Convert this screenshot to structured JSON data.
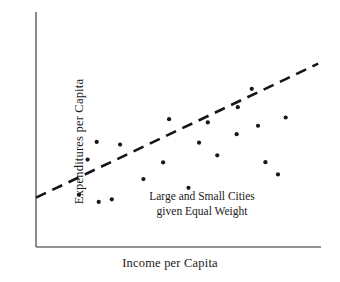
{
  "chart_data": {
    "type": "scatter",
    "title": "",
    "xlabel": "Income per Capita",
    "ylabel": "Expenditures per Capita",
    "annotation": {
      "line1": "Large and Small Cities",
      "line2": "given Equal Weight"
    },
    "grid": false,
    "legend": false,
    "axis_ticks": false,
    "xlim": [
      0,
      100
    ],
    "ylim": [
      0,
      100
    ],
    "colors": {
      "point": "#18181c",
      "trend_line": "#16161a",
      "axis": "#6e6e6e",
      "background": "#ffffff",
      "text": "#1a1a1a"
    },
    "points": [
      {
        "x": 15.1,
        "y": 22.2
      },
      {
        "x": 18.1,
        "y": 37.2
      },
      {
        "x": 21.3,
        "y": 44.7
      },
      {
        "x": 22.0,
        "y": 19.2
      },
      {
        "x": 26.6,
        "y": 20.3
      },
      {
        "x": 29.5,
        "y": 43.6
      },
      {
        "x": 37.7,
        "y": 28.9
      },
      {
        "x": 44.6,
        "y": 36.0
      },
      {
        "x": 46.7,
        "y": 54.4
      },
      {
        "x": 53.5,
        "y": 25.2
      },
      {
        "x": 57.2,
        "y": 44.4
      },
      {
        "x": 60.3,
        "y": 53.0
      },
      {
        "x": 63.6,
        "y": 39.0
      },
      {
        "x": 70.4,
        "y": 48.0
      },
      {
        "x": 70.8,
        "y": 59.5
      },
      {
        "x": 75.7,
        "y": 67.3
      },
      {
        "x": 77.9,
        "y": 51.6
      },
      {
        "x": 80.5,
        "y": 36.1
      },
      {
        "x": 84.9,
        "y": 30.9
      },
      {
        "x": 87.6,
        "y": 55.1
      }
    ],
    "trend": {
      "style": "dashed",
      "x_start": 0.0,
      "y_start": 21.0,
      "x_end": 99.0,
      "y_end": 78.0
    }
  },
  "figure": {
    "width": 340,
    "height": 282
  }
}
